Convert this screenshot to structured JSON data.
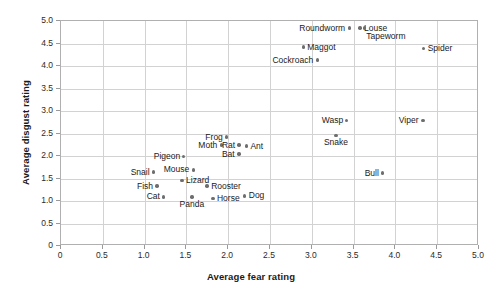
{
  "chart_data": {
    "type": "scatter",
    "title": "",
    "xlabel": "Average fear rating",
    "ylabel": "Average disgust rating",
    "xlim": [
      0,
      5.0
    ],
    "ylim": [
      0,
      5.0
    ],
    "xticks": [
      "0",
      "0.5",
      "1.0",
      "1.5",
      "2.0",
      "2.5",
      "3.0",
      "3.5",
      "4.0",
      "4.5",
      "5.0"
    ],
    "yticks": [
      "0",
      "0.5",
      "1.0",
      "1.5",
      "2.0",
      "2.5",
      "3.0",
      "3.5",
      "4.0",
      "4.5",
      "5.0"
    ],
    "grid": true,
    "legend": "none",
    "marker_color": "#6e6e6e",
    "grid_color": "#d2d2d2",
    "frame_color": "#b0b0b0",
    "points": [
      {
        "label": "Roundworm",
        "x": 3.46,
        "y": 4.82,
        "side": "left"
      },
      {
        "label": "Louse",
        "x": 3.59,
        "y": 4.82,
        "side": "right"
      },
      {
        "label": "Tapeworm",
        "x": 3.64,
        "y": 4.82,
        "side": "right2"
      },
      {
        "label": "Maggot",
        "x": 2.91,
        "y": 4.4,
        "side": "right"
      },
      {
        "label": "Spider",
        "x": 4.35,
        "y": 4.36,
        "side": "right"
      },
      {
        "label": "Cockroach",
        "x": 3.08,
        "y": 4.11,
        "side": "left"
      },
      {
        "label": "Wasp",
        "x": 3.43,
        "y": 2.76,
        "side": "left"
      },
      {
        "label": "Viper",
        "x": 4.34,
        "y": 2.76,
        "side": "left"
      },
      {
        "label": "Snake",
        "x": 3.3,
        "y": 2.44,
        "side": "below"
      },
      {
        "label": "Frog",
        "x": 1.99,
        "y": 2.4,
        "side": "left"
      },
      {
        "label": "Moth",
        "x": 1.93,
        "y": 2.22,
        "side": "left"
      },
      {
        "label": "Rat",
        "x": 2.14,
        "y": 2.22,
        "side": "left"
      },
      {
        "label": "Ant",
        "x": 2.23,
        "y": 2.2,
        "side": "right"
      },
      {
        "label": "Bat",
        "x": 2.14,
        "y": 2.02,
        "side": "left"
      },
      {
        "label": "Pigeon",
        "x": 1.48,
        "y": 1.96,
        "side": "left"
      },
      {
        "label": "Mouse",
        "x": 1.6,
        "y": 1.67,
        "side": "left"
      },
      {
        "label": "Snail",
        "x": 1.12,
        "y": 1.62,
        "side": "left"
      },
      {
        "label": "Bull",
        "x": 3.86,
        "y": 1.6,
        "side": "left"
      },
      {
        "label": "Lizard",
        "x": 1.46,
        "y": 1.44,
        "side": "right"
      },
      {
        "label": "Fish",
        "x": 1.16,
        "y": 1.31,
        "side": "left"
      },
      {
        "label": "Rooster",
        "x": 1.76,
        "y": 1.31,
        "side": "right"
      },
      {
        "label": "Dog",
        "x": 2.21,
        "y": 1.09,
        "side": "right"
      },
      {
        "label": "Cat",
        "x": 1.24,
        "y": 1.07,
        "side": "left"
      },
      {
        "label": "Horse",
        "x": 1.83,
        "y": 1.04,
        "side": "right"
      },
      {
        "label": "Panda",
        "x": 1.58,
        "y": 1.07,
        "side": "below"
      }
    ]
  }
}
